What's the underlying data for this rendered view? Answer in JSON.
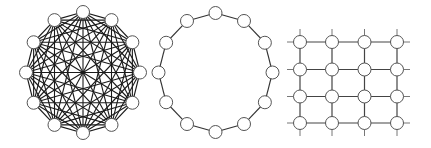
{
  "diagram": {
    "width": 431,
    "height": 148,
    "colors": {
      "background": "#ffffff",
      "node_fill": "#ffffff",
      "node_stroke": "#555555",
      "edge": "#1a1a1a"
    },
    "node_radius": 6.5,
    "panels": [
      {
        "name": "complete-graph",
        "type": "complete",
        "node_count": 12,
        "center": [
          83,
          72.5
        ],
        "radius": [
          57,
          60.5
        ]
      },
      {
        "name": "ring-graph",
        "type": "ring",
        "node_count": 12,
        "center": [
          215.5,
          72.5
        ],
        "radius": [
          57,
          59.5
        ]
      },
      {
        "name": "grid-graph",
        "type": "lattice",
        "rows": 4,
        "cols": 4,
        "x": [
          300,
          332,
          364.5,
          397
        ],
        "y": [
          42,
          69.5,
          96.5,
          123
        ],
        "stub_length": 13
      }
    ]
  }
}
